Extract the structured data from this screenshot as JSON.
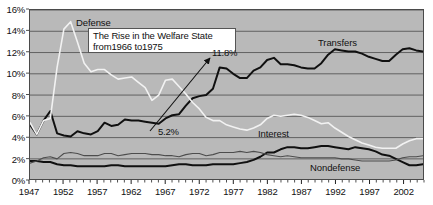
{
  "chart_data": {
    "type": "line",
    "title": "",
    "xlabel": "",
    "ylabel": "",
    "xlim": [
      1947,
      2005
    ],
    "ylim": [
      0,
      16
    ],
    "grid": true,
    "legend_position": "inline-labels",
    "y_ticks": [
      "0%",
      "2%",
      "4%",
      "6%",
      "8%",
      "10%",
      "12%",
      "14%",
      "16%"
    ],
    "y_tick_values": [
      0,
      2,
      4,
      6,
      8,
      10,
      12,
      14,
      16
    ],
    "x_ticks": [
      "1947",
      "1952",
      "1957",
      "1962",
      "1967",
      "1972",
      "1977",
      "1982",
      "1987",
      "1992",
      "1997",
      "2002"
    ],
    "x_tick_values": [
      1947,
      1952,
      1957,
      1962,
      1967,
      1972,
      1977,
      1982,
      1987,
      1992,
      1997,
      2002
    ],
    "x_minor_tick_step": 1,
    "annotations": [
      {
        "name": "callout",
        "line1": "The Rise in the Welfare State",
        "line2": "from1966 to1975"
      },
      {
        "name": "peak-value",
        "text": "11.8%"
      },
      {
        "name": "start-value",
        "text": "5.2%"
      }
    ],
    "series": [
      {
        "name": "Transfers",
        "label": "Transfers",
        "color": "#101010",
        "width": 2.0,
        "x": [
          1947,
          1948,
          1949,
          1950,
          1951,
          1952,
          1953,
          1954,
          1955,
          1956,
          1957,
          1958,
          1959,
          1960,
          1961,
          1962,
          1963,
          1964,
          1965,
          1966,
          1967,
          1968,
          1969,
          1970,
          1971,
          1972,
          1973,
          1974,
          1975,
          1976,
          1977,
          1978,
          1979,
          1980,
          1981,
          1982,
          1983,
          1984,
          1985,
          1986,
          1987,
          1988,
          1989,
          1990,
          1991,
          1992,
          1993,
          1994,
          1995,
          1996,
          1997,
          1998,
          1999,
          2000,
          2001,
          2002,
          2003,
          2004,
          2005
        ],
        "values": [
          5.2,
          4.3,
          5.6,
          6.5,
          4.4,
          4.2,
          4.1,
          4.6,
          4.4,
          4.3,
          4.6,
          5.4,
          5.1,
          5.2,
          5.7,
          5.6,
          5.6,
          5.5,
          5.4,
          5.3,
          5.8,
          6.1,
          6.2,
          7.0,
          7.7,
          7.9,
          8.0,
          8.6,
          10.6,
          10.5,
          10.0,
          9.6,
          9.6,
          10.3,
          10.6,
          11.3,
          11.5,
          10.9,
          10.9,
          10.8,
          10.6,
          10.5,
          10.5,
          11.0,
          11.8,
          12.3,
          12.2,
          12.1,
          12.1,
          11.9,
          11.6,
          11.4,
          11.2,
          11.2,
          11.8,
          12.3,
          12.4,
          12.2,
          12.1
        ]
      },
      {
        "name": "Defense",
        "label": "Defense",
        "color": "#f2f2f2",
        "width": 1.6,
        "x": [
          1947,
          1948,
          1949,
          1950,
          1951,
          1952,
          1953,
          1954,
          1955,
          1956,
          1957,
          1958,
          1959,
          1960,
          1961,
          1962,
          1963,
          1964,
          1965,
          1966,
          1967,
          1968,
          1969,
          1970,
          1971,
          1972,
          1973,
          1974,
          1975,
          1976,
          1977,
          1978,
          1979,
          1980,
          1981,
          1982,
          1983,
          1984,
          1985,
          1986,
          1987,
          1988,
          1989,
          1990,
          1991,
          1992,
          1993,
          1994,
          1995,
          1996,
          1997,
          1998,
          1999,
          2000,
          2001,
          2002,
          2003,
          2004,
          2005
        ],
        "values": [
          5.4,
          4.3,
          5.6,
          5.8,
          10.6,
          14.2,
          14.9,
          13.0,
          11.0,
          10.2,
          10.4,
          10.4,
          9.9,
          9.5,
          9.6,
          9.7,
          9.2,
          8.7,
          7.5,
          8.0,
          9.4,
          9.5,
          8.8,
          8.1,
          7.3,
          6.7,
          5.9,
          5.6,
          5.6,
          5.2,
          5.0,
          4.8,
          4.7,
          4.9,
          5.2,
          5.8,
          6.1,
          6.0,
          6.1,
          6.2,
          6.1,
          5.9,
          5.6,
          5.3,
          5.4,
          4.9,
          4.5,
          4.1,
          3.8,
          3.5,
          3.3,
          3.1,
          3.0,
          3.0,
          3.0,
          3.4,
          3.7,
          3.9,
          3.9
        ]
      },
      {
        "name": "Interest",
        "label": "Interest",
        "color": "#101010",
        "width": 2.0,
        "x": [
          1947,
          1948,
          1949,
          1950,
          1951,
          1952,
          1953,
          1954,
          1955,
          1956,
          1957,
          1958,
          1959,
          1960,
          1961,
          1962,
          1963,
          1964,
          1965,
          1966,
          1967,
          1968,
          1969,
          1970,
          1971,
          1972,
          1973,
          1974,
          1975,
          1976,
          1977,
          1978,
          1979,
          1980,
          1981,
          1982,
          1983,
          1984,
          1985,
          1986,
          1987,
          1988,
          1989,
          1990,
          1991,
          1992,
          1993,
          1994,
          1995,
          1996,
          1997,
          1998,
          1999,
          2000,
          2001,
          2002,
          2003,
          2004,
          2005
        ],
        "values": [
          1.8,
          1.8,
          1.7,
          1.7,
          1.5,
          1.4,
          1.4,
          1.3,
          1.3,
          1.3,
          1.3,
          1.3,
          1.4,
          1.4,
          1.3,
          1.3,
          1.3,
          1.3,
          1.3,
          1.3,
          1.3,
          1.4,
          1.5,
          1.5,
          1.4,
          1.4,
          1.4,
          1.5,
          1.5,
          1.5,
          1.5,
          1.6,
          1.7,
          1.9,
          2.2,
          2.6,
          2.6,
          2.9,
          3.1,
          3.1,
          3.0,
          3.0,
          3.1,
          3.2,
          3.2,
          3.1,
          3.0,
          2.9,
          3.1,
          3.0,
          2.9,
          2.7,
          2.4,
          2.3,
          2.0,
          1.7,
          1.4,
          1.4,
          1.5
        ]
      },
      {
        "name": "Nondefense",
        "label": "Nondefense",
        "color": "#4d4d4d",
        "width": 1.1,
        "x": [
          1947,
          1948,
          1949,
          1950,
          1951,
          1952,
          1953,
          1954,
          1955,
          1956,
          1957,
          1958,
          1959,
          1960,
          1961,
          1962,
          1963,
          1964,
          1965,
          1966,
          1967,
          1968,
          1969,
          1970,
          1971,
          1972,
          1973,
          1974,
          1975,
          1976,
          1977,
          1978,
          1979,
          1980,
          1981,
          1982,
          1983,
          1984,
          1985,
          1986,
          1987,
          1988,
          1989,
          1990,
          1991,
          1992,
          1993,
          1994,
          1995,
          1996,
          1997,
          1998,
          1999,
          2000,
          2001,
          2002,
          2003,
          2004,
          2005
        ],
        "values": [
          1.6,
          1.8,
          2.1,
          2.2,
          2.0,
          2.5,
          2.6,
          2.5,
          2.3,
          2.3,
          2.3,
          2.5,
          2.5,
          2.3,
          2.4,
          2.5,
          2.5,
          2.5,
          2.4,
          2.4,
          2.3,
          2.3,
          2.2,
          2.4,
          2.5,
          2.5,
          2.3,
          2.4,
          2.6,
          2.6,
          2.6,
          2.7,
          2.6,
          2.7,
          2.6,
          2.4,
          2.3,
          2.2,
          2.3,
          2.2,
          2.1,
          2.1,
          2.1,
          2.1,
          2.1,
          2.1,
          2.0,
          2.0,
          1.9,
          1.8,
          1.8,
          1.8,
          1.8,
          1.8,
          1.9,
          2.1,
          2.2,
          2.2,
          2.3
        ]
      }
    ]
  }
}
